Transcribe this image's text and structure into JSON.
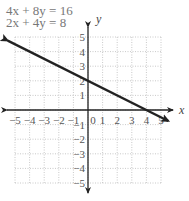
{
  "chart_data": {
    "type": "line",
    "title": "",
    "equations": [
      "4x + 8y = 16",
      "2x + 4y = 8"
    ],
    "xlabel": "x",
    "ylabel": "y",
    "xlim": [
      -5,
      5
    ],
    "ylim": [
      -5,
      5
    ],
    "grid": true,
    "x_ticks": [
      "-5",
      "-4",
      "-3",
      "-2",
      "-1",
      "0",
      "1",
      "2",
      "3",
      "4",
      "5"
    ],
    "y_ticks": [
      "-5",
      "-4",
      "-3",
      "-2",
      "-1",
      "1",
      "2",
      "3",
      "4",
      "5"
    ],
    "series": [
      {
        "name": "4x + 8y = 16 / 2x + 4y = 8 (same line)",
        "x": [
          -5.5,
          0,
          4,
          5.5
        ],
        "y": [
          4.75,
          2,
          0,
          -0.75
        ],
        "color": "#222222"
      }
    ]
  },
  "labels": {
    "eq1": "4x + 8y = 16",
    "eq2": "2x + 4y = 8",
    "x_axis": "x",
    "y_axis": "y"
  }
}
